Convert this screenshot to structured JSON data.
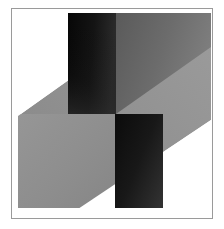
{
  "artwork": {
    "title": "Geometric Abstract Composition",
    "medium": "flat geometric shapes with linear gradients",
    "style": "constructivist",
    "canvas": {
      "width": 224,
      "height": 229,
      "background": "#ffffff"
    },
    "frame": {
      "name": "border-frame",
      "x": 11,
      "y": 8,
      "width": 201,
      "height": 210,
      "stroke": "#9a9a9a",
      "stroke_width": 1,
      "fill": "#ffffff"
    },
    "palette": {
      "white": "#ffffff",
      "light_gray": "#8e8e8e",
      "light_gray_edge": "#9d9d9d",
      "mid_gray": "#6a6a6a",
      "mid_gray_edge": "#7b7b7b",
      "near_black": "#161616",
      "black": "#0b0b0b",
      "dark_gray": "#3a3a3a",
      "frame_stroke": "#9a9a9a"
    },
    "shapes": [
      {
        "name": "light-parallelogram-sweep",
        "type": "parallelogram",
        "fill": "light_gray",
        "points": "18,115 166,13 212,13 212,118 64,212 18,212",
        "note": "large light gray band sweeping from lower-left to upper-right"
      },
      {
        "name": "upper-dark-bar",
        "type": "rectangle",
        "fill_gradient": "near_black",
        "x": 68,
        "y": 13,
        "width": 48,
        "height": 100
      },
      {
        "name": "upper-mid-gray-panel",
        "type": "parallelogram",
        "fill": "mid_gray",
        "points": "116,13 166,13 212,13 212,46 116,113",
        "note": "darker gray wedge right of upper dark bar"
      },
      {
        "name": "lower-dark-bar",
        "type": "rectangle",
        "fill_gradient": "black",
        "x": 115,
        "y": 113,
        "width": 48,
        "height": 95
      },
      {
        "name": "lower-left-light-panel",
        "type": "parallelogram",
        "fill": "light_gray",
        "points": "18,115 115,115 115,208 64,208 18,208"
      }
    ],
    "gradients": [
      {
        "name": "upper-bar-gradient",
        "from": "#0d0d0d",
        "to": "#2e2e2e",
        "angle_deg": 90
      },
      {
        "name": "lower-bar-gradient",
        "from": "#101010",
        "to": "#333333",
        "angle_deg": 80
      },
      {
        "name": "mid-panel-gradient",
        "from": "#5e5e5e",
        "to": "#7c7c7c",
        "angle_deg": 25
      },
      {
        "name": "light-sweep-gradient",
        "from": "#8a8a8a",
        "to": "#9b9b9b",
        "angle_deg": 135
      }
    ]
  }
}
